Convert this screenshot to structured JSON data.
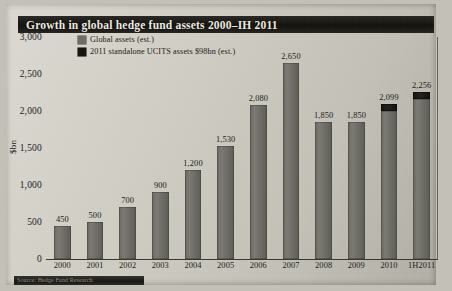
{
  "header": {
    "title": "Growth in global hedge fund assets 2000–IH 2011"
  },
  "footer": {
    "source": "Source: Hedge Fund Research"
  },
  "legend": [
    {
      "label": "Global assets (est.)",
      "color": "#6e6c66",
      "key": "global"
    },
    {
      "label": "2011 standalone UCITS assets $98bn (est.)",
      "color": "#15140f",
      "key": "ucits"
    }
  ],
  "chart_data": {
    "type": "bar",
    "title": "Growth in global hedge fund assets 2000–IH 2011",
    "xlabel": "",
    "ylabel": "$bn",
    "ylim": [
      0,
      3000
    ],
    "yticks": [
      "0",
      "500",
      "1,000",
      "1,500",
      "2,000",
      "2,500",
      "3,000"
    ],
    "ytick_values": [
      0,
      500,
      1000,
      1500,
      2000,
      2500,
      3000
    ],
    "grid": false,
    "legend_position": "top-left-inside",
    "stacked": true,
    "categories": [
      "2000",
      "2001",
      "2002",
      "2003",
      "2004",
      "2005",
      "2006",
      "2007",
      "2008",
      "2009",
      "2010",
      "1H2011"
    ],
    "series": [
      {
        "name": "Global assets (est.)",
        "color": "#6e6c66",
        "values": [
          450,
          500,
          700,
          900,
          1200,
          1530,
          2080,
          2650,
          1850,
          1850,
          2001,
          2158
        ]
      },
      {
        "name": "2011 standalone UCITS assets $98bn (est.)",
        "color": "#15140f",
        "values": [
          0,
          0,
          0,
          0,
          0,
          0,
          0,
          0,
          0,
          0,
          98,
          98
        ]
      }
    ],
    "totals": [
      450,
      500,
      700,
      900,
      1200,
      1530,
      2080,
      2650,
      1850,
      1850,
      2099,
      2256
    ],
    "data_labels": [
      "450",
      "500",
      "700",
      "900",
      "1,200",
      "1,530",
      "2,080",
      "2,650",
      "1,850",
      "1,850",
      "2,099",
      "2,256"
    ]
  }
}
